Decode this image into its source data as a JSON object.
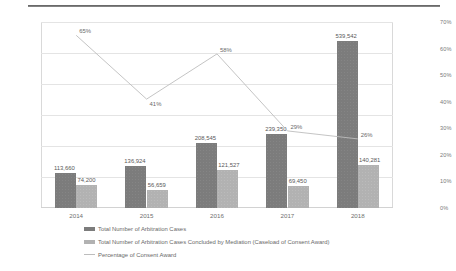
{
  "chart_data": {
    "type": "bar",
    "title": "",
    "xlabel": "",
    "ylabel": "",
    "categories": [
      "2014",
      "2015",
      "2016",
      "2017",
      "2018"
    ],
    "grid": true,
    "legend_position": "bottom-left",
    "yaxis_left": {
      "min": 0,
      "max": 600000,
      "step": 100000,
      "ticks": [
        "0",
        "100,000",
        "200,000",
        "300,000",
        "400,000",
        "500,000",
        "600,000"
      ]
    },
    "yaxis_right": {
      "min": 0,
      "max": 70,
      "step": 10,
      "ticks": [
        "0%",
        "10%",
        "20%",
        "30%",
        "40%",
        "50%",
        "60%",
        "70%"
      ]
    },
    "series": [
      {
        "name": "Total Number of Arbitration Cases",
        "type": "bar",
        "axis": "left",
        "color": "#7c7c7c",
        "values": [
          113660,
          136924,
          208545,
          239350,
          539542
        ],
        "labels": [
          "113,660",
          "136,924",
          "208,545",
          "239,350",
          "539,542"
        ]
      },
      {
        "name": "Total Number of Arbitration Cases Concluded by Mediation (Caseload of Consent Award)",
        "type": "bar",
        "axis": "left",
        "color": "#b2b2b2",
        "values": [
          74200,
          56659,
          121527,
          69450,
          140281
        ],
        "labels": [
          "74,200",
          "56,659",
          "121,527",
          "69,450",
          "140,281"
        ]
      },
      {
        "name": "Percentage of Consent Award",
        "type": "line",
        "axis": "right",
        "color": "#bdbdbd",
        "values": [
          65,
          41,
          58,
          29,
          26
        ],
        "labels": [
          "65%",
          "41%",
          "58%",
          "29%",
          "26%"
        ]
      }
    ]
  },
  "legend": {
    "items": [
      {
        "label": "Total Number of Arbitration Cases",
        "swatch": "dark"
      },
      {
        "label": "Total Number of Arbitration Cases Concluded by Mediation (Caseload of Consent Award)",
        "swatch": "light"
      },
      {
        "label": "Percentage of Consent Award",
        "swatch": "line"
      }
    ]
  }
}
